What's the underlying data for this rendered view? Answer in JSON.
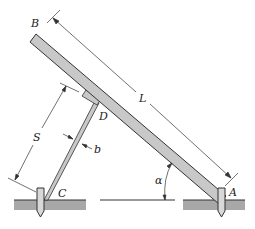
{
  "diagram": {
    "type": "mechanics figure",
    "labels": {
      "B": "B",
      "A": "A",
      "C": "C",
      "D": "D",
      "L": "L",
      "S": "S",
      "b": "b",
      "alpha": "α"
    },
    "colors": {
      "beam_fill": "#c8c8c8",
      "ground_fill": "#a8a8a8",
      "stroke": "#333333"
    }
  }
}
